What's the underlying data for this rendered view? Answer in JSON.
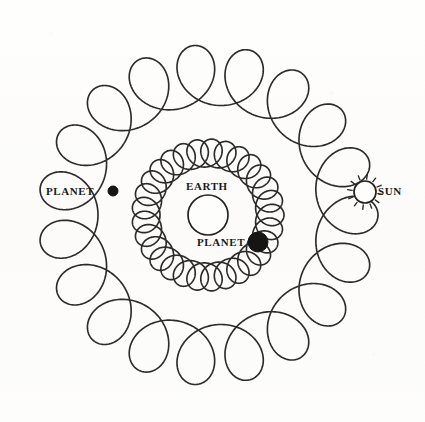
{
  "figure": {
    "kind": "ptolemaic-epicycle-diagram",
    "width": 425,
    "height": 422,
    "background_color": "#fdfdfc",
    "ink_color": "#2b2b2b"
  },
  "labels": {
    "earth": "EARTH",
    "sun": "SUN",
    "planet_outer": "PLANET",
    "planet_inner": "PLANET"
  },
  "bodies": {
    "earth": {
      "name": "earth-circle",
      "cx": 208,
      "cy": 215,
      "r": 20,
      "style": "open-circle"
    },
    "sun": {
      "name": "sun-symbol",
      "cx": 365,
      "cy": 192,
      "r": 11,
      "style": "rayed-circle",
      "ray_count": 12
    },
    "planet_outer": {
      "name": "planet-marker-outer",
      "cx": 113,
      "cy": 191,
      "r": 5,
      "style": "filled-dot"
    },
    "planet_inner": {
      "name": "planet-marker-inner",
      "cx": 258,
      "cy": 242,
      "r": 10,
      "style": "filled-dot"
    }
  },
  "chart_data": {
    "type": "line",
    "title": "",
    "xlabel": "",
    "ylabel": "",
    "center": [
      208,
      215
    ],
    "grid": false,
    "legend_position": "none",
    "series": [
      {
        "name": "inner-planet-epicycloid",
        "curve": "epitrochoid",
        "deferent_radius": 62,
        "epicycle_radius": 14,
        "loops": 28,
        "loop_apex_radius": 88,
        "stroke": "#2b2b2b",
        "stroke_width": 1.65
      },
      {
        "name": "outer-planet-epicycloid",
        "curve": "epitrochoid",
        "deferent_radius": 140,
        "epicycle_radius": 30,
        "loops": 18,
        "loop_apex_radius": 198,
        "stroke": "#2b2b2b",
        "stroke_width": 1.65
      }
    ],
    "annotations": [
      {
        "text": "EARTH",
        "x": 208,
        "y": 188,
        "anchor": "middle"
      },
      {
        "text": "SUN",
        "x": 380,
        "y": 192,
        "anchor": "start"
      },
      {
        "text": "PLANET",
        "x": 90,
        "y": 192,
        "anchor": "end"
      },
      {
        "text": "PLANET",
        "x": 243,
        "y": 243,
        "anchor": "end"
      }
    ]
  }
}
